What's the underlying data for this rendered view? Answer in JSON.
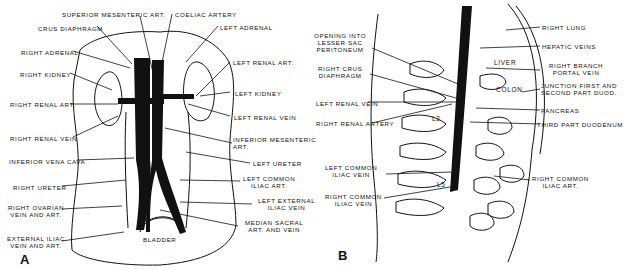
{
  "figure": {
    "panels": [
      {
        "id": "A",
        "label": "A",
        "labels_left": [
          "CRUS DIAPHRAGM",
          "RIGHT ADRENAL",
          "RIGHT KIDNEY",
          "RIGHT RENAL ART.",
          "RIGHT RENAL VEIN",
          "INFERIOR VENA CAVA",
          "RIGHT URETER",
          "RIGHT OVARIAN\nVEIN AND ART.",
          "EXTERNAL ILIAC\nVEIN AND ART."
        ],
        "labels_top": [
          "SUPERIOR MESENTERIC ART.",
          "COELIAC ARTERY"
        ],
        "labels_right": [
          "LEFT ADRENAL",
          "LEFT RENAL ART.",
          "LEFT KIDNEY",
          "LEFT RENAL VEIN",
          "INFERIOR MESENTERIC\nART.",
          "LEFT URETER",
          "LEFT COMMON\nILIAC ART.",
          "LEFT EXTERNAL\nILIAC VEIN",
          "MEDIAN SACRAL\nART. AND VEIN"
        ],
        "inner_labels": [
          "BLADDER"
        ]
      },
      {
        "id": "B",
        "label": "B",
        "labels_left": [
          "OPENING INTO\nLESSER SAC\nPERITONEUM",
          "RIGHT CRUS\nDIAPHRAGM",
          "LEFT RENAL VEIN",
          "RIGHT RENAL ARTERY",
          "LEFT COMMON\nILIAC VEIN",
          "RIGHT COMMON\nILIAC VEIN"
        ],
        "labels_right": [
          "RIGHT LUNG",
          "HEPATIC VEINS",
          "RIGHT BRANCH\nPORTAL VEIN",
          "JUNCTION FIRST AND\nSECOND PART DUOD.",
          "PANCREAS",
          "THIRD PART DUODENUM",
          "RIGHT COMMON\nILIAC ART."
        ],
        "inner_labels": [
          "LIVER",
          "COLON",
          "L2",
          "L5"
        ]
      }
    ]
  }
}
